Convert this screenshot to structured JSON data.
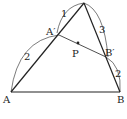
{
  "diagram": {
    "type": "triangle-geometry",
    "points": {
      "A": {
        "label": "A",
        "x": 11,
        "y": 92
      },
      "B": {
        "label": "B",
        "x": 120,
        "y": 92
      },
      "C": {
        "label": "",
        "x": 84,
        "y": 3
      },
      "A_prime": {
        "label": "A′",
        "x": 59,
        "y": 35
      },
      "B_prime": {
        "label": "B′",
        "x": 106,
        "y": 57
      },
      "P": {
        "label": "P",
        "x": 78,
        "y": 43
      }
    },
    "arc_labels": {
      "C_to_A_prime": "1",
      "A_prime_to_A": "2",
      "C_to_B_prime": "3",
      "B_prime_to_B": "2"
    },
    "stroke_color": "#222222"
  }
}
